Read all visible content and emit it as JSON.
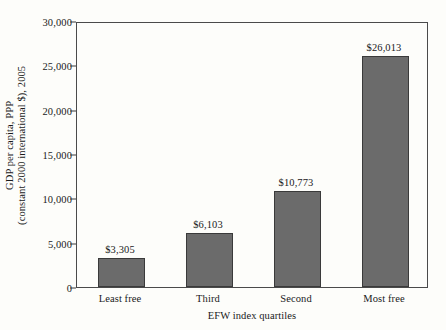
{
  "chart_data": {
    "type": "bar",
    "title": "",
    "subtitle": "",
    "categories": [
      "Least free",
      "Third",
      "Second",
      "Most free"
    ],
    "values": [
      3305,
      10773,
      6103,
      26013
    ],
    "series": [
      {
        "name": "GDP per capita, PPP",
        "categories": [
          "Least free",
          "Third",
          "Second",
          "Most free"
        ],
        "values": [
          3305,
          6103,
          10773,
          26013
        ],
        "value_labels": [
          "$3,305",
          "$6,103",
          "$10,773",
          "$26,013"
        ]
      }
    ],
    "bars": [
      {
        "category": "Least free",
        "value": 3305,
        "label": "$3,305"
      },
      {
        "category": "Third",
        "value": 6103,
        "label": "$6,103"
      },
      {
        "category": "Second",
        "value": 10773,
        "label": "$10,773"
      },
      {
        "category": "Most free",
        "value": 26013,
        "label": "$26,013"
      }
    ],
    "xlabel": "EFW index quartiles",
    "ylabel_line1": "GDP per capita, PPP",
    "ylabel_line2": "(constant 2000 international $), 2005",
    "ylim": [
      0,
      30000
    ],
    "yticks": [
      0,
      5000,
      10000,
      15000,
      20000,
      25000,
      30000
    ],
    "ytick_labels": [
      "0",
      "5,000",
      "10,000",
      "15,000",
      "20,000",
      "25,000",
      "30,000"
    ],
    "grid": false,
    "legend": false,
    "legend_position": "none",
    "colors": {
      "bar_fill": "#6b6b6b",
      "bar_edge": "#3a3a3a",
      "axis": "#4a4a4a",
      "text": "#1a1a1a",
      "background": "#fdfdfa"
    }
  }
}
